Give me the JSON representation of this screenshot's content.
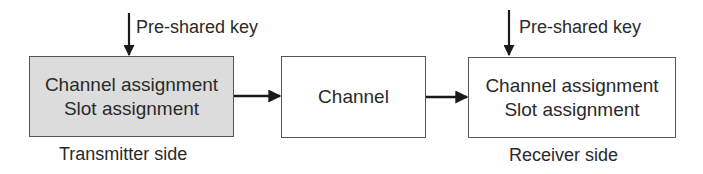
{
  "diagram": {
    "transmitter": {
      "lines": [
        "Channel assignment",
        "Slot assignment"
      ],
      "caption": "Transmitter side",
      "key_label": "Pre-shared key",
      "fill": "#dcdcdc"
    },
    "channel": {
      "label": "Channel"
    },
    "receiver": {
      "lines": [
        "Channel assignment",
        "Slot assignment"
      ],
      "caption": "Receiver side",
      "key_label": "Pre-shared key",
      "fill": "#ffffff"
    },
    "edges": [
      {
        "from": "pre-shared-key",
        "to": "transmitter"
      },
      {
        "from": "transmitter",
        "to": "channel"
      },
      {
        "from": "channel",
        "to": "receiver"
      },
      {
        "from": "pre-shared-key",
        "to": "receiver"
      }
    ]
  }
}
